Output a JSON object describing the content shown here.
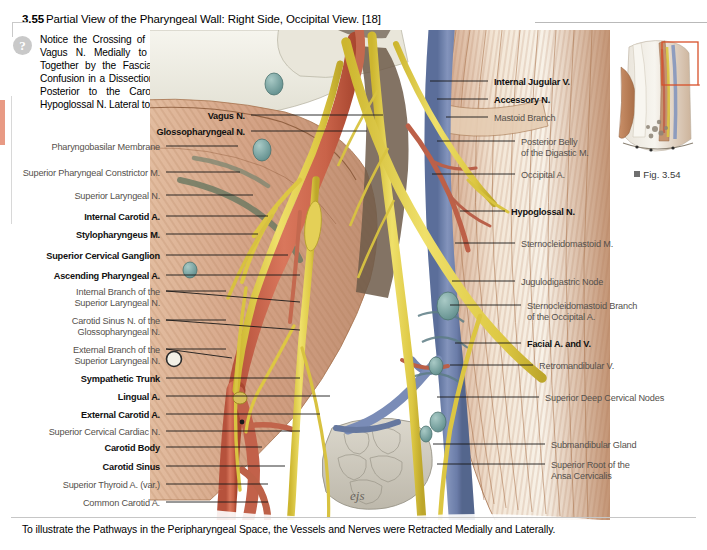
{
  "figure": {
    "number": "3.55",
    "title": "Partial View of the Pharyngeal Wall: Right Side, Occipital View. [18]",
    "caption": "To illustrate the Pathways in the Peripharyngeal Space, the Vessels and Nerves were Retracted Medially and Laterally.",
    "note_icon": "question-mark-icon",
    "note": "Notice the Crossing of the CN XII over the Vagus N. Medially to Laterally, Sheathed Together by the Fascia, which may cause Confusion in a Dissection. The Vagus N. runs Posterior to the Carotid Artery and the Hypoglossal N. Lateral to the Arteries."
  },
  "thumbnail": {
    "caption": "Fig. 3.54",
    "marker": "square-bullet-icon"
  },
  "colors": {
    "nerve_yellow": "#e8d44a",
    "artery_red": "#cf6a52",
    "vein_blue": "#7b8fc0",
    "muscle_tan": "#d9a98a",
    "node_teal": "#7fa8a8",
    "gland_grey": "#cfcbc2",
    "fascia_white": "#efeee6",
    "leader_line": "#1a1a1a",
    "bold_label": "#111111",
    "plain_label": "#55504c",
    "edge_tab": "#e89a84",
    "thumb_box": "#d8502a"
  },
  "labels_left": [
    {
      "text": "Vagus N.",
      "weight": "bold",
      "x": 245,
      "y": 111,
      "lx": 251,
      "ly": 115,
      "tx": 383,
      "ty": 115
    },
    {
      "text": "Glossopharyngeal N.",
      "weight": "bold",
      "x": 245,
      "y": 127,
      "lx": 251,
      "ly": 131,
      "tx": 367,
      "ty": 131
    },
    {
      "text": "Pharyngobasilar Membrane",
      "weight": "plain",
      "x": 160,
      "y": 142,
      "lx": 166,
      "ly": 146,
      "tx": 238,
      "ty": 146
    },
    {
      "text": "Superior Pharyngeal Constrictor M.",
      "weight": "plain",
      "x": 160,
      "y": 168,
      "lx": 166,
      "ly": 172,
      "tx": 240,
      "ty": 172
    },
    {
      "text": "Superior Laryngeal N.",
      "weight": "plain",
      "x": 160,
      "y": 191,
      "lx": 166,
      "ly": 195,
      "tx": 253,
      "ty": 195
    },
    {
      "text": "Internal Carotid A.",
      "weight": "bold",
      "x": 160,
      "y": 212,
      "lx": 166,
      "ly": 216,
      "tx": 268,
      "ty": 216
    },
    {
      "text": "Stylopharyngeus M.",
      "weight": "bold",
      "x": 160,
      "y": 230,
      "lx": 166,
      "ly": 234,
      "tx": 258,
      "ty": 234
    },
    {
      "text": "Superior Cervical Ganglion",
      "weight": "bold",
      "x": 160,
      "y": 251,
      "lx": 166,
      "ly": 255,
      "tx": 288,
      "ty": 255
    },
    {
      "text": "Ascending Pharyngeal A.",
      "weight": "bold",
      "x": 160,
      "y": 271,
      "lx": 166,
      "ly": 275,
      "tx": 300,
      "ty": 275
    },
    {
      "text": "Internal Branch of the",
      "text2": "Superior Laryngeal N.",
      "weight": "plain",
      "x": 160,
      "y": 287,
      "lx": 166,
      "ly": 291,
      "tx": 300,
      "ty": 302
    },
    {
      "text": "Carotid Sinus N. of the",
      "text2": "Glossopharyngeal N.",
      "weight": "plain",
      "x": 160,
      "y": 316,
      "lx": 166,
      "ly": 320,
      "tx": 300,
      "ty": 330
    },
    {
      "text": "External Branch of the",
      "text2": "Superior Laryngeal N.",
      "weight": "plain",
      "x": 160,
      "y": 345,
      "lx": 166,
      "ly": 349,
      "tx": 232,
      "ty": 358
    },
    {
      "text": "Sympathetic Trunk",
      "weight": "bold",
      "x": 160,
      "y": 374,
      "lx": 166,
      "ly": 378,
      "tx": 300,
      "ty": 378
    },
    {
      "text": "Lingual A.",
      "weight": "bold",
      "x": 160,
      "y": 392,
      "lx": 166,
      "ly": 396,
      "tx": 330,
      "ty": 396
    },
    {
      "text": "External Carotid A.",
      "weight": "bold",
      "x": 160,
      "y": 410,
      "lx": 166,
      "ly": 414,
      "tx": 320,
      "ty": 414
    },
    {
      "text": "Superior Cervical Cardiac N.",
      "weight": "plain",
      "x": 160,
      "y": 427,
      "lx": 166,
      "ly": 431,
      "tx": 300,
      "ty": 431
    },
    {
      "text": "Carotid Body",
      "weight": "bold",
      "x": 160,
      "y": 443,
      "lx": 166,
      "ly": 447,
      "tx": 262,
      "ty": 447
    },
    {
      "text": "Carotid Sinus",
      "weight": "bold",
      "x": 160,
      "y": 462,
      "lx": 166,
      "ly": 466,
      "tx": 285,
      "ty": 466
    },
    {
      "text": "Superior Thyroid A. (var.)",
      "weight": "plain",
      "x": 160,
      "y": 480,
      "lx": 166,
      "ly": 484,
      "tx": 268,
      "ty": 484
    },
    {
      "text": "Common Carotid A.",
      "weight": "plain",
      "x": 160,
      "y": 498,
      "lx": 166,
      "ly": 502,
      "tx": 268,
      "ty": 502
    }
  ],
  "labels_right": [
    {
      "text": "Internal Jugular V.",
      "weight": "bold",
      "x": 494,
      "y": 77,
      "lx": 488,
      "ly": 81,
      "tx": 430,
      "ty": 81
    },
    {
      "text": "Accessory N.",
      "weight": "bold",
      "x": 494,
      "y": 95,
      "lx": 488,
      "ly": 99,
      "tx": 437,
      "ty": 99
    },
    {
      "text": "Mastoid Branch",
      "weight": "plain",
      "x": 494,
      "y": 113,
      "lx": 488,
      "ly": 117,
      "tx": 446,
      "ty": 117
    },
    {
      "text": "Posterior Belly",
      "text2": "of the Digastic M.",
      "weight": "plain",
      "x": 521,
      "y": 137,
      "lx": 515,
      "ly": 141,
      "tx": 437,
      "ty": 141
    },
    {
      "text": "Occipital A.",
      "weight": "plain",
      "x": 521,
      "y": 170,
      "lx": 515,
      "ly": 174,
      "tx": 432,
      "ty": 174
    },
    {
      "text": "Hypoglossal N.",
      "weight": "bold",
      "x": 511,
      "y": 207,
      "lx": 505,
      "ly": 211,
      "tx": 460,
      "ty": 211
    },
    {
      "text": "Sternocleidomastoid M.",
      "weight": "plain",
      "x": 521,
      "y": 239,
      "lx": 515,
      "ly": 243,
      "tx": 455,
      "ty": 243
    },
    {
      "text": "Jugulodigastric Node",
      "weight": "plain",
      "x": 521,
      "y": 277,
      "lx": 515,
      "ly": 281,
      "tx": 452,
      "ty": 281
    },
    {
      "text": "Sternocleidomastoid Branch",
      "text2": "of the Occipital A.",
      "weight": "plain",
      "x": 527,
      "y": 301,
      "lx": 521,
      "ly": 305,
      "tx": 450,
      "ty": 305
    },
    {
      "text": "Facial A. and V.",
      "weight": "bold",
      "x": 527,
      "y": 339,
      "lx": 521,
      "ly": 343,
      "tx": 455,
      "ty": 343
    },
    {
      "text": "Retromandibular V.",
      "weight": "plain",
      "x": 539,
      "y": 361,
      "lx": 533,
      "ly": 365,
      "tx": 450,
      "ty": 365
    },
    {
      "text": "Superior Deep Cervical Nodes",
      "weight": "plain",
      "x": 545,
      "y": 393,
      "lx": 539,
      "ly": 397,
      "tx": 437,
      "ty": 397
    },
    {
      "text": "Submandibular Gland",
      "weight": "plain",
      "x": 551,
      "y": 440,
      "lx": 545,
      "ly": 444,
      "tx": 433,
      "ty": 444
    },
    {
      "text": "Superior Root of the",
      "text2": "Ansa Cervicalis",
      "weight": "plain",
      "x": 551,
      "y": 460,
      "lx": 545,
      "ly": 464,
      "tx": 437,
      "ty": 464
    }
  ]
}
